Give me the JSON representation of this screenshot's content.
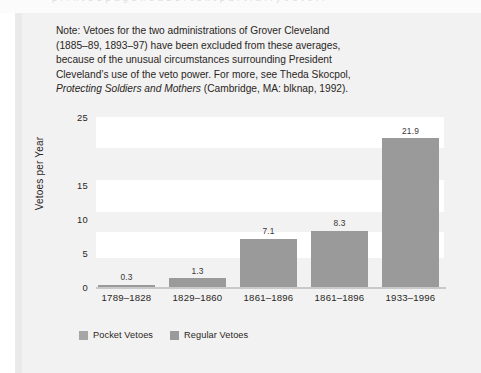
{
  "page": {
    "bleed_text": "p r i n t e d   p a g e   h e a d e r   t e x t   p a r t i a l l y   c u t   o f f"
  },
  "note": {
    "lines": [
      "Note: Vetoes for the two administrations of Grover Cleveland",
      "(1885–89, 1893–97) have been excluded from these averages,",
      "because of the unusual circumstances surrounding President",
      "Cleveland’s use of the veto power. For more, see Theda Skocpol,"
    ],
    "italic_title": "Protecting Soldiers and Mothers",
    "citation_tail": " (Cambridge, MA: blknap, 1992)."
  },
  "chart_data": {
    "type": "bar",
    "title": "",
    "xlabel": "",
    "ylabel": "Vetoes per Year",
    "categories": [
      "1789–1828",
      "1829–1860",
      "1861–1896",
      "1861–1896",
      "1933–1996"
    ],
    "values": [
      0.3,
      1.3,
      7.1,
      8.3,
      21.9
    ],
    "value_labels": [
      "0.3",
      "1.3",
      "7.1",
      "8.3",
      "21.9"
    ],
    "ylim": [
      0,
      25
    ],
    "ytick_labels": [
      "25",
      "15",
      "10",
      "5",
      "0"
    ],
    "ytick_values": [
      25,
      15,
      10,
      5,
      0
    ],
    "grid": false,
    "banded_background": true,
    "legend_position": "bottom-left",
    "legend": [
      {
        "label": "Pocket Vetoes",
        "color": "#a6a6a6"
      },
      {
        "label": "Regular Vetoes",
        "color": "#9a9a9a"
      }
    ],
    "series": [
      {
        "name": "Regular Vetoes",
        "values": [
          0.3,
          1.3,
          7.1,
          8.3,
          21.9
        ]
      }
    ],
    "colors": {
      "bar": "#9a9a9a",
      "plot_band_light": "#ffffff",
      "plot_background": "#f2f2f2",
      "figure_background": "#f2f2f2",
      "text": "#2a2623"
    }
  }
}
